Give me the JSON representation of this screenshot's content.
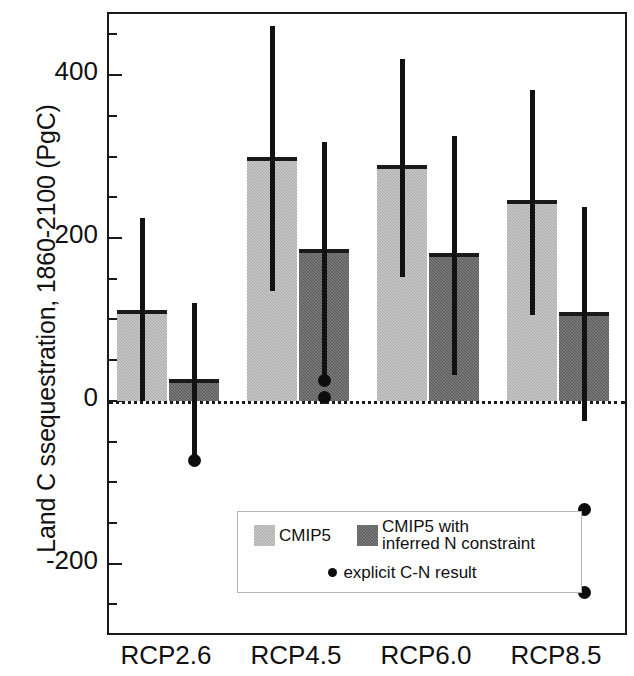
{
  "chart_data": {
    "type": "bar",
    "title": "",
    "xlabel": "",
    "ylabel": "Land C ssequestration, 1860-2100 (PgC)",
    "categories": [
      "RCP2.6",
      "RCP4.5",
      "RCP6.0",
      "RCP8.5"
    ],
    "ylim": [
      -290,
      475
    ],
    "yticks": [
      400,
      200,
      0,
      -200
    ],
    "ytick_labels": [
      "400",
      "200",
      "0",
      "-200"
    ],
    "yminor_ticks": [
      450,
      350,
      300,
      250,
      150,
      100,
      50,
      -50,
      -100,
      -150,
      -250
    ],
    "grid": false,
    "zero_line": true,
    "legend_position": "inside-lower-left",
    "series": [
      {
        "name": "CMIP5",
        "color": "#a9a9a9",
        "values": [
          110,
          298,
          288,
          245
        ],
        "err_low": [
          0,
          135,
          152,
          105
        ],
        "err_high": [
          225,
          460,
          420,
          382
        ]
      },
      {
        "name": "CMIP5 with inferred N constraint",
        "color": "#575757",
        "values": [
          25,
          185,
          180,
          108
        ],
        "err_low": [
          -70,
          30,
          32,
          -25
        ],
        "err_high": [
          120,
          318,
          325,
          238
        ]
      }
    ],
    "points": {
      "name": "explicit C-N result",
      "color": "#0d0d0d",
      "values": [
        {
          "category": "RCP2.6",
          "y": [
            -73
          ]
        },
        {
          "category": "RCP4.5",
          "y": [
            25,
            5
          ]
        },
        {
          "category": "RCP6.0",
          "y": [
            -160
          ]
        },
        {
          "category": "RCP8.5",
          "y": [
            -133,
            -235
          ]
        }
      ]
    },
    "legend": [
      {
        "label": "CMIP5",
        "swatch": "light"
      },
      {
        "label": "CMIP5 with\ninferred N constraint",
        "swatch": "dark"
      },
      {
        "label": "explicit C-N result",
        "swatch": "dot"
      }
    ]
  }
}
